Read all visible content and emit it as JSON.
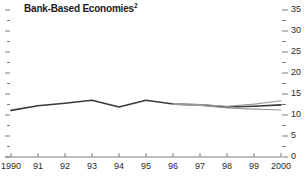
{
  "chart_data": {
    "type": "line",
    "title": "Bank-Based Economies",
    "title_superscript": "2",
    "xlabel": "",
    "ylabel": "",
    "xlim": [
      1990,
      2000
    ],
    "ylim": [
      0,
      35
    ],
    "grid": false,
    "legend": "none",
    "y_ticks_major": [
      0,
      5,
      10,
      15,
      20,
      25,
      30,
      35
    ],
    "y_ticks_minor": [
      2.5,
      7.5,
      12.5,
      17.5,
      22.5,
      27.5,
      32.5
    ],
    "y_tick_labels": [
      "0",
      "5",
      "10",
      "15",
      "20",
      "25",
      "30",
      "35"
    ],
    "y_axis_side": "right",
    "x_ticks": [
      1990,
      1991,
      1992,
      1993,
      1994,
      1995,
      1996,
      1997,
      1998,
      1999,
      2000
    ],
    "x_tick_labels": [
      "1990",
      "91",
      "92",
      "93",
      "94",
      "95",
      "96",
      "97",
      "98",
      "99",
      "2000"
    ],
    "x": [
      1990,
      1991,
      1992,
      1993,
      1994,
      1995,
      1996,
      1997,
      1998,
      1999,
      2000
    ],
    "series": [
      {
        "name": "actual",
        "color": "#3a3a3a",
        "width": 1.6,
        "values": [
          11.1,
          12.2,
          12.8,
          13.5,
          11.9,
          13.5,
          12.6,
          12.4,
          11.9,
          12.1,
          12.4
        ]
      },
      {
        "name": "upper-projection",
        "color": "#9a9a9a",
        "width": 1.1,
        "values": [
          null,
          null,
          null,
          null,
          null,
          null,
          12.6,
          12.5,
          12.1,
          12.6,
          13.4
        ]
      },
      {
        "name": "lower-projection",
        "color": "#9a9a9a",
        "width": 1.1,
        "values": [
          null,
          null,
          null,
          null,
          null,
          null,
          12.6,
          12.3,
          11.7,
          11.4,
          11.2
        ]
      }
    ],
    "axis_color": "#7d7d7d",
    "tick_color": "#7d7d7d",
    "text_color": "#2b2b2b"
  }
}
